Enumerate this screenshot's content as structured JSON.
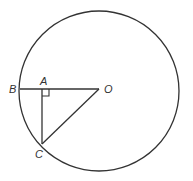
{
  "diagram": {
    "type": "circle-geometry",
    "stroke_color": "#333333",
    "background": "#ffffff",
    "circle": {
      "center_label": "O",
      "cx": 99,
      "cy": 91,
      "r": 80
    },
    "points": {
      "O": {
        "label": "O",
        "x": 99,
        "y": 89
      },
      "A": {
        "label": "A",
        "x": 42,
        "y": 89
      },
      "B": {
        "label": "B",
        "x": 20,
        "y": 89
      },
      "C": {
        "label": "C",
        "x": 42,
        "y": 144
      }
    },
    "segments": [
      {
        "from": "B",
        "to": "O"
      },
      {
        "from": "A",
        "to": "C"
      },
      {
        "from": "O",
        "to": "C"
      }
    ],
    "right_angle_marker": {
      "at": "A",
      "between": [
        "O",
        "C"
      ]
    }
  }
}
